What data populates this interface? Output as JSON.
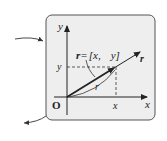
{
  "diagram": {
    "type": "vector-in-plane",
    "panel": {
      "background": "#eeeeee",
      "border": "#555555"
    },
    "axes": {
      "x_label": "x",
      "y_label": "y",
      "origin_label": "O"
    },
    "point_labels": {
      "x_tick": "x",
      "y_tick": "y"
    },
    "vector": {
      "name": "r",
      "equation": "r = [x,   y]",
      "equation_parts": {
        "lhs": "r",
        "eq": "=",
        "bracket_open": "[",
        "x": "x,",
        "y": "y",
        "bracket_close": "]"
      },
      "magnitude_label": "r"
    },
    "callout_arrows": [
      {
        "name": "incoming-arrow",
        "side": "left-top"
      },
      {
        "name": "outgoing-arrow",
        "side": "left-bottom"
      }
    ]
  }
}
